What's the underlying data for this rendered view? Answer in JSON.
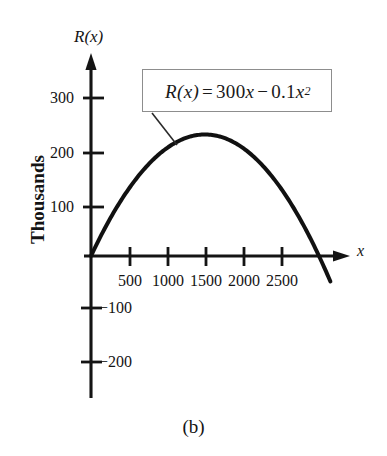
{
  "figure": {
    "caption": "(b)",
    "background_color": "#ffffff",
    "curve_color": "#111111",
    "axis_color": "#141414",
    "box_border_color": "#8d8d8d"
  },
  "equation": {
    "lhs": "R(x)",
    "equals": "=",
    "term1_coef": "300",
    "term1_var": "x",
    "minus": "−",
    "term2_coef": "0.1",
    "term2_var": "x",
    "term2_exp": "2",
    "full_text": "R(x) = 300x − 0.1x²"
  },
  "axis_names": {
    "y": "R(x)",
    "x": "x",
    "y_title": "Thousands"
  },
  "chart_data": {
    "type": "line",
    "title": "",
    "subtitle": "",
    "xlabel": "x",
    "ylabel": "R(x)",
    "y_axis_units_label": "Thousands",
    "annotation": "R(x) = 300x − 0.1x²",
    "grid": false,
    "legend_position": "none",
    "function": "R(x) = 300x - 0.1x^2",
    "xlim": [
      -120,
      3400
    ],
    "ylim": [
      -260,
      360
    ],
    "xticks": [
      500,
      1000,
      1500,
      2000,
      2500
    ],
    "xtick_labels": [
      "500",
      "1000",
      "1500",
      "2000",
      "2500"
    ],
    "yticks": [
      300,
      200,
      100,
      -100,
      -200
    ],
    "ytick_labels": [
      "300",
      "200",
      "100",
      "−100",
      "−200"
    ],
    "y_scale_note": "values shown in thousands",
    "vertex": {
      "x": 1500,
      "y": 225
    },
    "roots": [
      0,
      3000
    ],
    "x": [
      0,
      150,
      300,
      450,
      600,
      750,
      900,
      1050,
      1200,
      1350,
      1500,
      1650,
      1800,
      1950,
      2100,
      2250,
      2400,
      2550,
      2700,
      2850,
      3000,
      3150
    ],
    "y": [
      0,
      42.75,
      81,
      115.0,
      144,
      168.75,
      189,
      204.75,
      216,
      222.75,
      225,
      222.75,
      216,
      204.75,
      189,
      168.75,
      144,
      115.0,
      81,
      42.75,
      0,
      -47.25
    ],
    "series": [
      {
        "name": "R(x) = 300x - 0.1x^2",
        "values": [
          0,
          42.75,
          81,
          115.0,
          144,
          168.75,
          189,
          204.75,
          216,
          222.75,
          225,
          222.75,
          216,
          204.75,
          189,
          168.75,
          144,
          115.0,
          81,
          42.75,
          0,
          -47.25
        ]
      }
    ]
  },
  "ticks": {
    "y_positive": [
      {
        "label": "300"
      },
      {
        "label": "200"
      },
      {
        "label": "100"
      }
    ],
    "y_negative": [
      {
        "label": "−100"
      },
      {
        "label": "−200"
      }
    ],
    "x": [
      {
        "label": "500"
      },
      {
        "label": "1000"
      },
      {
        "label": "1500"
      },
      {
        "label": "2000"
      },
      {
        "label": "2500"
      }
    ]
  }
}
